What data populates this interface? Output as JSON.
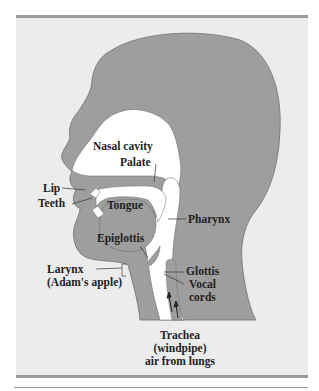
{
  "figure": {
    "colors": {
      "background": "#ececec",
      "head": "#9e9e9e",
      "airway": "#ffffff",
      "outline": "#6e6e6e",
      "rule": "#9a9a9a",
      "text": "#222222"
    },
    "labels": {
      "nasal_cavity": "Nasal cavity",
      "palate": "Palate",
      "lip": "Lip",
      "teeth": "Teeth",
      "tongue": "Tongue",
      "pharynx": "Pharynx",
      "epiglottis": "Epiglottis",
      "glottis": "Glottis",
      "vocal": "Vocal",
      "cords": "cords",
      "larynx": "Larynx",
      "adams_apple": "(Adam's apple)",
      "trachea": "Trachea",
      "windpipe": "(windpipe)",
      "air_from_lungs": "air from lungs"
    },
    "icons": {
      "airflow": "up-arrow-icon"
    }
  }
}
